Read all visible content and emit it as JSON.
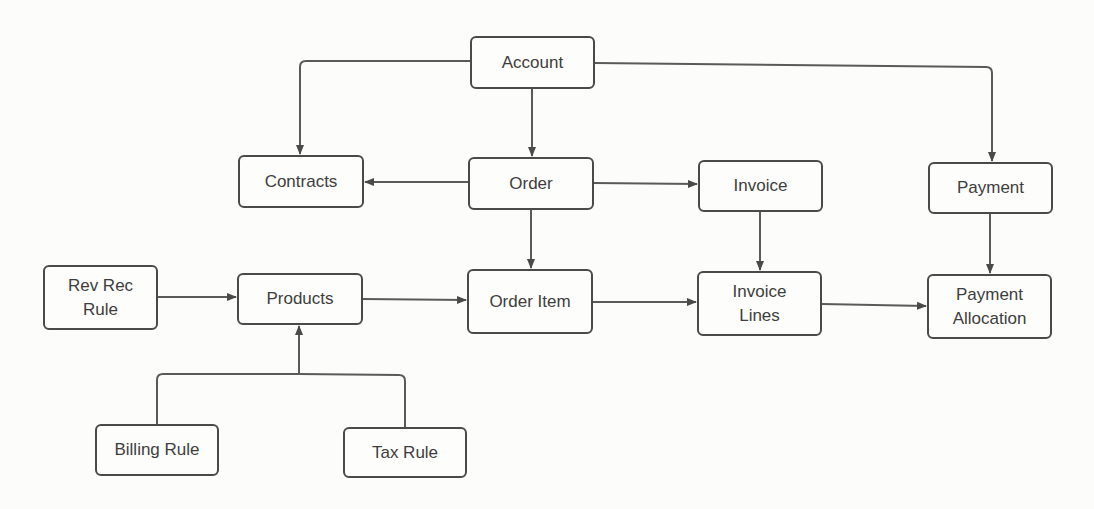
{
  "diagram": {
    "colors": {
      "stroke": "#4a4a4a",
      "text": "#3e3e3e",
      "background": "#fcfcfa"
    },
    "nodes": [
      {
        "id": "account",
        "label": "Account",
        "x": 470,
        "y": 36,
        "w": 125,
        "h": 53
      },
      {
        "id": "contracts",
        "label": "Contracts",
        "x": 238,
        "y": 155,
        "w": 126,
        "h": 53
      },
      {
        "id": "order",
        "label": "Order",
        "x": 468,
        "y": 157,
        "w": 126,
        "h": 53
      },
      {
        "id": "invoice",
        "label": "Invoice",
        "x": 698,
        "y": 160,
        "w": 125,
        "h": 52
      },
      {
        "id": "payment",
        "label": "Payment",
        "x": 928,
        "y": 162,
        "w": 125,
        "h": 52
      },
      {
        "id": "rev-rec-rule",
        "label": "Rev Rec\nRule",
        "x": 43,
        "y": 265,
        "w": 115,
        "h": 65
      },
      {
        "id": "products",
        "label": "Products",
        "x": 237,
        "y": 273,
        "w": 126,
        "h": 52
      },
      {
        "id": "order-item",
        "label": "Order Item",
        "x": 467,
        "y": 269,
        "w": 126,
        "h": 65
      },
      {
        "id": "invoice-lines",
        "label": "Invoice\nLines",
        "x": 697,
        "y": 271,
        "w": 125,
        "h": 65
      },
      {
        "id": "payment-allocation",
        "label": "Payment\nAllocation",
        "x": 927,
        "y": 274,
        "w": 125,
        "h": 65
      },
      {
        "id": "billing-rule",
        "label": "Billing Rule",
        "x": 95,
        "y": 424,
        "w": 124,
        "h": 52
      },
      {
        "id": "tax-rule",
        "label": "Tax Rule",
        "x": 343,
        "y": 427,
        "w": 124,
        "h": 51
      }
    ],
    "edges": [
      {
        "from": "account",
        "to": "contracts"
      },
      {
        "from": "account",
        "to": "order"
      },
      {
        "from": "account",
        "to": "payment"
      },
      {
        "from": "order",
        "to": "contracts"
      },
      {
        "from": "order",
        "to": "invoice"
      },
      {
        "from": "order",
        "to": "order-item"
      },
      {
        "from": "invoice",
        "to": "invoice-lines"
      },
      {
        "from": "payment",
        "to": "payment-allocation"
      },
      {
        "from": "rev-rec-rule",
        "to": "products"
      },
      {
        "from": "products",
        "to": "order-item"
      },
      {
        "from": "order-item",
        "to": "invoice-lines"
      },
      {
        "from": "invoice-lines",
        "to": "payment-allocation"
      },
      {
        "from": "billing-rule",
        "to": "products"
      },
      {
        "from": "tax-rule",
        "to": "products"
      }
    ]
  }
}
